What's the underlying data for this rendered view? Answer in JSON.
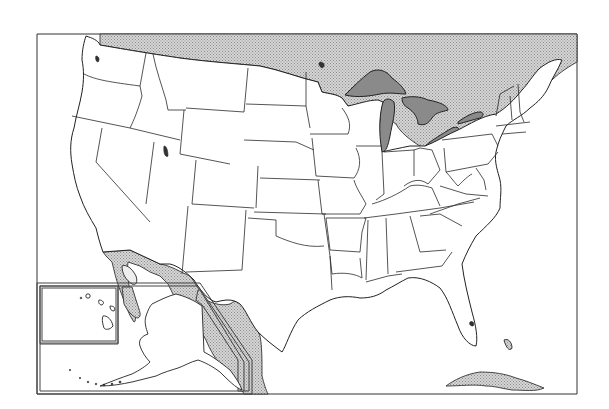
{
  "map": {
    "title": "",
    "type": "blank outline map",
    "region": "United States",
    "insets": [
      "Hawaii",
      "Alaska"
    ],
    "features": {
      "foreign_land": [
        "Canada",
        "Mexico",
        "Cuba",
        "Bahamas"
      ],
      "water_bodies_shaded": [
        "Lake Superior",
        "Lake Michigan",
        "Lake Huron",
        "Lake Erie",
        "Lake Ontario",
        "Great Salt Lake"
      ]
    },
    "colors": {
      "background": "#ffffff",
      "foreign_land": "#c8c8c8",
      "lakes": "#8a8a8a",
      "borders": "#222222"
    }
  }
}
